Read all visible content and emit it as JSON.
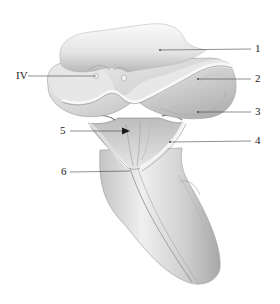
{
  "diagram": {
    "type": "anatomical-illustration",
    "colors": {
      "background": "#ffffff",
      "tissue_light": "#f2f2f2",
      "tissue_mid": "#d2d2d2",
      "tissue_dark": "#9a9a9a",
      "leader_line": "#444444",
      "label_text": "#222222"
    },
    "labels": [
      {
        "id": "1",
        "text": "1",
        "side": "right"
      },
      {
        "id": "IV",
        "text": "IV",
        "side": "left"
      },
      {
        "id": "2",
        "text": "2",
        "side": "right"
      },
      {
        "id": "3",
        "text": "3",
        "side": "right"
      },
      {
        "id": "5",
        "text": "5",
        "side": "left"
      },
      {
        "id": "4",
        "text": "4",
        "side": "right"
      },
      {
        "id": "6",
        "text": "6",
        "side": "left"
      }
    ]
  }
}
